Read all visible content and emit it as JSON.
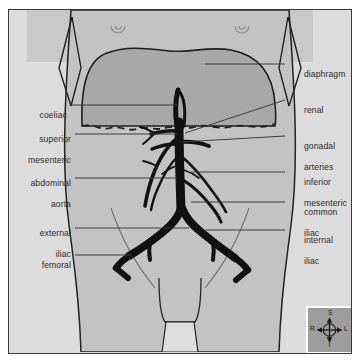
{
  "figure": {
    "background_color": "#dcdcdc",
    "body_fill": "#c3c3c3",
    "chest_fill": "#bdbdbd",
    "diaphragm_fill": "#a8a8a8",
    "vessel_color": "#111111",
    "outline_color": "#222222",
    "leader_color": "#444444",
    "label_color": "#2b2b2b"
  },
  "labels_left": [
    {
      "id": "coeliac",
      "text": "coeliac",
      "line1": "coeliac",
      "line2": ""
    },
    {
      "id": "superior-mesenteric",
      "text": "superior mesenteric",
      "line1": "superior",
      "line2": "mesenteric"
    },
    {
      "id": "abdominal-aorta",
      "text": "abdominal aorta",
      "line1": "abdominal",
      "line2": "aorta"
    },
    {
      "id": "external-iliac",
      "text": "external iliac",
      "line1": "external",
      "line2": "iliac"
    },
    {
      "id": "femoral",
      "text": "femoral",
      "line1": "femoral",
      "line2": ""
    }
  ],
  "labels_right": [
    {
      "id": "diaphragm",
      "text": "diaphragm",
      "line1": "diaphragm",
      "line2": ""
    },
    {
      "id": "renal",
      "text": "renal",
      "line1": "renal",
      "line2": ""
    },
    {
      "id": "gonadal-arteries",
      "text": "gonadal arteries",
      "line1": "gonadal",
      "line2": "arteries"
    },
    {
      "id": "inferior-mesenteric",
      "text": "inferior mesenteric",
      "line1": "inferior",
      "line2": "mesenteric"
    },
    {
      "id": "common-iliac",
      "text": "common iliac",
      "line1": "common",
      "line2": "iliac"
    },
    {
      "id": "internal-iliac",
      "text": "internal iliac",
      "line1": "internal",
      "line2": "iliac"
    }
  ],
  "compass": {
    "name": "orientation-compass",
    "superior": "S",
    "inferior": "I",
    "right": "R",
    "left": "L"
  }
}
